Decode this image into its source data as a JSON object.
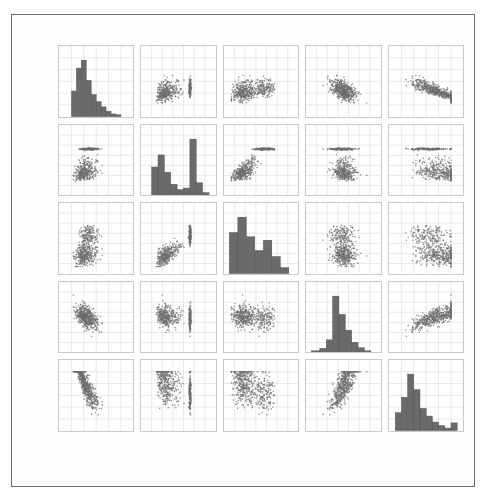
{
  "figure": {
    "kind": "scatter-plot-matrix",
    "background_color": "#ffffff",
    "frame_color": "#6b6b6b",
    "marker_color": "#6e6e6e",
    "bar_color": "#6a6a6a",
    "grid_color": "#d9d9d9"
  },
  "chart_data": {
    "type": "scatter",
    "title": "",
    "subtitle": "",
    "xlabel": "",
    "ylabel": "",
    "grid": true,
    "legend": null,
    "layout": "5x5 scatter plot matrix (pairs plot) with histograms on the diagonal",
    "variables": [
      "LSTAT",
      "INDUS",
      "NOX",
      "RM",
      "MEDV"
    ],
    "row_labels": [
      "LSTAT",
      "INDUS",
      "NOX",
      "RM",
      "MEDV"
    ],
    "column_labels": [
      "LSTAT",
      "INDUS",
      "NOX",
      "RM",
      "MEDV"
    ],
    "axes": {
      "LSTAT": {
        "range": [
          -10,
          50
        ],
        "ticks": [
          -10,
          0,
          10,
          20,
          30,
          40,
          50
        ],
        "tick_labels": [
          "-10",
          "0",
          "10",
          "20",
          "30",
          "40",
          "50"
        ]
      },
      "INDUS": {
        "range": [
          -5,
          30
        ],
        "ticks": [
          -5,
          0,
          5,
          10,
          15,
          20,
          25,
          30
        ],
        "tick_labels": [
          "-5",
          "0",
          "5",
          "10",
          "15",
          "20",
          "25",
          "30"
        ]
      },
      "NOX": {
        "range": [
          0.3,
          1.0
        ],
        "ticks": [
          0.3,
          0.4,
          0.5,
          0.6,
          0.7,
          0.8,
          0.9,
          1.0
        ],
        "tick_labels": [
          "0.3",
          "0.4",
          "0.5",
          "0.6",
          "0.7",
          "0.8",
          "0.9",
          "1.0"
        ]
      },
      "RM": {
        "range": [
          3,
          10
        ],
        "ticks": [
          3,
          4,
          5,
          6,
          7,
          8,
          9,
          10
        ],
        "tick_labels": [
          "3",
          "4",
          "5",
          "6",
          "7",
          "8",
          "9",
          "10"
        ]
      },
      "MEDV": {
        "range": [
          0,
          60
        ],
        "ticks": [
          0,
          10,
          20,
          30,
          40,
          50,
          60
        ],
        "tick_labels": [
          "0",
          "10",
          "20",
          "30",
          "40",
          "50",
          "60"
        ]
      }
    },
    "diagonal_histograms": [
      {
        "variable": "LSTAT",
        "shape": "right-skewed unimodal",
        "bin_edges": [
          0,
          4,
          8,
          12,
          16,
          20,
          24,
          28,
          32,
          36,
          40
        ],
        "counts": [
          58,
          110,
          128,
          82,
          50,
          34,
          22,
          12,
          6,
          4
        ]
      },
      {
        "variable": "INDUS",
        "shape": "bimodal with tall spike near 18",
        "bin_edges": [
          0,
          3,
          6,
          9,
          12,
          15,
          18,
          21,
          24,
          27
        ],
        "counts": [
          76,
          108,
          62,
          30,
          16,
          20,
          150,
          34,
          8
        ]
      },
      {
        "variable": "NOX",
        "shape": "right-skewed, concentrated at low values",
        "bin_edges": [
          0.35,
          0.43,
          0.51,
          0.59,
          0.67,
          0.75,
          0.83,
          0.91
        ],
        "counts": [
          96,
          132,
          86,
          54,
          78,
          40,
          14
        ]
      },
      {
        "variable": "RM",
        "shape": "sharply peaked, approximately normal",
        "bin_edges": [
          3.5,
          4.3,
          4.9,
          5.5,
          6.1,
          6.7,
          7.3,
          7.9,
          8.5,
          9.1
        ],
        "counts": [
          6,
          14,
          42,
          186,
          126,
          74,
          34,
          16,
          6
        ]
      },
      {
        "variable": "MEDV",
        "shape": "right-skewed with censored spike at 50",
        "bin_edges": [
          5,
          10,
          15,
          20,
          25,
          30,
          35,
          40,
          45,
          50,
          55
        ],
        "counts": [
          42,
          78,
          132,
          96,
          52,
          34,
          20,
          12,
          6,
          18
        ]
      }
    ],
    "pair_relationships": [
      {
        "x": "INDUS",
        "y": "LSTAT",
        "direction": "positive",
        "strength": "moderate",
        "note": "vertical stripe at INDUS 18"
      },
      {
        "x": "NOX",
        "y": "LSTAT",
        "direction": "positive",
        "strength": "moderate"
      },
      {
        "x": "RM",
        "y": "LSTAT",
        "direction": "negative",
        "strength": "strong",
        "note": "curved"
      },
      {
        "x": "MEDV",
        "y": "LSTAT",
        "direction": "negative",
        "strength": "strong",
        "note": "curved"
      },
      {
        "x": "LSTAT",
        "y": "INDUS",
        "direction": "positive",
        "strength": "moderate"
      },
      {
        "x": "NOX",
        "y": "INDUS",
        "direction": "positive",
        "strength": "strong"
      },
      {
        "x": "RM",
        "y": "INDUS",
        "direction": "negative",
        "strength": "weak"
      },
      {
        "x": "MEDV",
        "y": "INDUS",
        "direction": "negative",
        "strength": "moderate"
      },
      {
        "x": "LSTAT",
        "y": "NOX",
        "direction": "positive",
        "strength": "moderate"
      },
      {
        "x": "INDUS",
        "y": "NOX",
        "direction": "positive",
        "strength": "strong"
      },
      {
        "x": "RM",
        "y": "NOX",
        "direction": "negative",
        "strength": "weak"
      },
      {
        "x": "MEDV",
        "y": "NOX",
        "direction": "negative",
        "strength": "moderate"
      },
      {
        "x": "LSTAT",
        "y": "RM",
        "direction": "negative",
        "strength": "strong"
      },
      {
        "x": "INDUS",
        "y": "RM",
        "direction": "negative",
        "strength": "weak"
      },
      {
        "x": "NOX",
        "y": "RM",
        "direction": "negative",
        "strength": "weak"
      },
      {
        "x": "MEDV",
        "y": "RM",
        "direction": "positive",
        "strength": "strong"
      },
      {
        "x": "LSTAT",
        "y": "MEDV",
        "direction": "negative",
        "strength": "strong"
      },
      {
        "x": "INDUS",
        "y": "MEDV",
        "direction": "negative",
        "strength": "moderate"
      },
      {
        "x": "NOX",
        "y": "MEDV",
        "direction": "negative",
        "strength": "moderate"
      },
      {
        "x": "RM",
        "y": "MEDV",
        "direction": "positive",
        "strength": "strong",
        "note": "row of points at MEDV 50"
      }
    ]
  }
}
